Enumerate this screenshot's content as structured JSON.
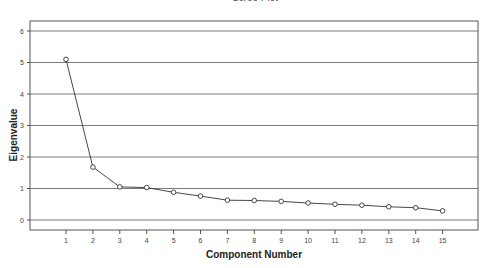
{
  "chart_data": {
    "type": "line",
    "title": "Scree Plot",
    "xlabel": "Component Number",
    "ylabel": "Eigenvalue",
    "x": [
      1,
      2,
      3,
      4,
      5,
      6,
      7,
      8,
      9,
      10,
      11,
      12,
      13,
      14,
      15
    ],
    "categories": [
      "1",
      "2",
      "3",
      "4",
      "5",
      "6",
      "7",
      "8",
      "9",
      "10",
      "11",
      "12",
      "13",
      "14",
      "15"
    ],
    "series": [
      {
        "name": "Eigenvalue",
        "values": [
          5.1,
          1.68,
          1.05,
          1.03,
          0.88,
          0.76,
          0.63,
          0.62,
          0.59,
          0.54,
          0.5,
          0.47,
          0.42,
          0.39,
          0.29
        ],
        "marker": "open-circle",
        "color": "#333333"
      }
    ],
    "yticks": [
      0,
      1,
      2,
      3,
      4,
      5,
      6
    ],
    "ylim": [
      -0.35,
      6.3
    ],
    "xlim": [
      0,
      16.2
    ],
    "grid": {
      "horizontal": true,
      "vertical": false,
      "color": "#7a7a7a"
    },
    "legend": null
  }
}
